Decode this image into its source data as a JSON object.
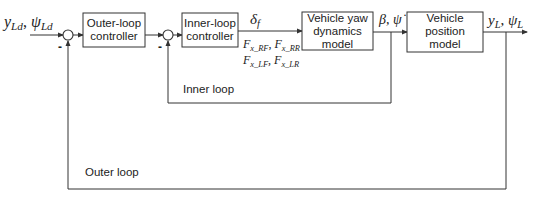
{
  "blocks": {
    "outer_controller": {
      "line1": "Outer-loop",
      "line2": "controller"
    },
    "inner_controller": {
      "line1": "Inner-loop",
      "line2": "controller"
    },
    "yaw_model": {
      "line1": "Vehicle yaw",
      "line2": "dynamics",
      "line3": "model"
    },
    "position_model": {
      "line1": "Vehicle",
      "line2": "position",
      "line3": "model"
    }
  },
  "signals": {
    "reference": {
      "a": "y",
      "a_sub": "Ld",
      "b": "ψ",
      "b_sub": "Ld"
    },
    "steer": {
      "sym": "δ",
      "sub": "f"
    },
    "forces_row1": {
      "a": "F",
      "a_sub": "x_RF",
      "b": "F",
      "b_sub": "x_RR"
    },
    "forces_row2": {
      "a": "F",
      "a_sub": "x_LF",
      "b": "F",
      "b_sub": "x_LR"
    },
    "yaw_states": {
      "text": "β, ψ̇"
    },
    "output": {
      "a": "y",
      "a_sub": "L",
      "b": "ψ",
      "b_sub": "L"
    }
  },
  "sum_signs": {
    "outer": "-",
    "inner": "-"
  },
  "loops": {
    "inner": "Inner loop",
    "outer": "Outer loop"
  },
  "colors": {
    "stroke": "#333333",
    "text": "#222222",
    "background": "#ffffff"
  }
}
